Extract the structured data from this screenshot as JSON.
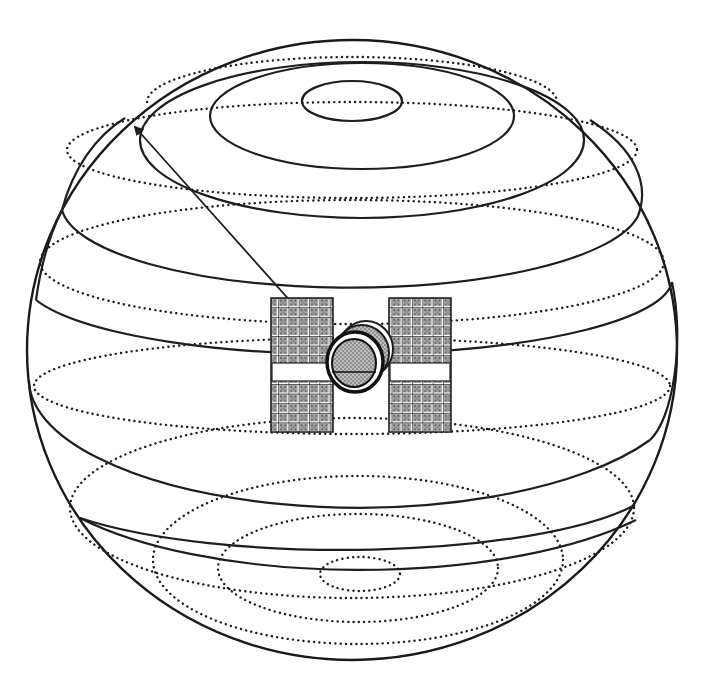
{
  "diagram": {
    "colors": {
      "line": "#1e1e1e",
      "background": "#ffffff",
      "panel_fill": "#9a9a9a"
    },
    "sphere": {
      "cx": 352,
      "cy": 350,
      "rx": 325,
      "ry": 310
    },
    "solid_rings": [
      {
        "cx": 352,
        "cy": 101,
        "rx": 50,
        "ry": 20
      },
      {
        "cx": 358,
        "cy": 115,
        "rx": 152,
        "ry": 54
      },
      {
        "cx": 362,
        "cy": 145,
        "rx": 222,
        "ry": 74
      },
      {
        "cx": 352,
        "cy": 205,
        "rx": 290,
        "ry": 92
      },
      {
        "cx": 352,
        "cy": 300,
        "rx": 322,
        "ry": 206,
        "arc": "lower"
      },
      {
        "cx": 352,
        "cy": 360,
        "rx": 320,
        "ry": 145,
        "arc": "lower"
      },
      {
        "cx": 352,
        "cy": 440,
        "rx": 318,
        "ry": 150,
        "arc": "lower"
      },
      {
        "cx": 352,
        "cy": 500,
        "rx": 285,
        "ry": 150,
        "arc": "lower"
      }
    ],
    "dotted_rings": [
      {
        "cx": 352,
        "cy": 102,
        "rx": 205,
        "ry": 45,
        "arc": "upper"
      },
      {
        "cx": 352,
        "cy": 150,
        "rx": 285,
        "ry": 48
      },
      {
        "cx": 352,
        "cy": 260,
        "rx": 310,
        "ry": 60
      },
      {
        "cx": 352,
        "cy": 385,
        "rx": 318,
        "ry": 48
      },
      {
        "cx": 352,
        "cy": 510,
        "rx": 280,
        "ry": 92
      },
      {
        "cx": 358,
        "cy": 560,
        "rx": 205,
        "ry": 85
      },
      {
        "cx": 358,
        "cy": 566,
        "rx": 140,
        "ry": 56
      },
      {
        "cx": 358,
        "cy": 574,
        "rx": 40,
        "ry": 18
      }
    ],
    "satellite": {
      "label": "satellite",
      "left_panel": {
        "x": 271,
        "y": 298,
        "w": 62,
        "h": 134
      },
      "right_panel": {
        "x": 389,
        "y": 298,
        "w": 62,
        "h": 134
      },
      "panel_gap": {
        "y": 363,
        "h": 18
      },
      "body": {
        "cx": 352,
        "cy": 365,
        "r": 27
      }
    },
    "arrow": {
      "label": "line-of-sight vector",
      "from": [
        332,
        352
      ],
      "to": [
        133,
        124
      ]
    }
  }
}
